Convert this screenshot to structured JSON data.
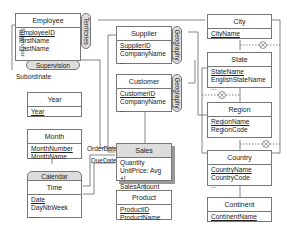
{
  "diagram": {
    "levels": {
      "employee": {
        "title": "Employee",
        "attrs": [
          "EmployeeID",
          "FirstName",
          "LastName"
        ],
        "key": "EmployeeID"
      },
      "supplier": {
        "title": "Supplier",
        "attrs": [
          "SupplierID",
          "CompanyName",
          "..."
        ],
        "key": "SupplierID"
      },
      "customer": {
        "title": "Customer",
        "attrs": [
          "CustomerID",
          "CompanyName",
          "..."
        ],
        "key": "CustomerID"
      },
      "city": {
        "title": "City",
        "attrs": [
          "CityName"
        ],
        "key": "CityName"
      },
      "state": {
        "title": "State",
        "attrs": [
          "StateName",
          "EnglishStateName",
          "..."
        ],
        "key": "StateName"
      },
      "region": {
        "title": "Region",
        "attrs": [
          "RegionName",
          "RegionCode"
        ],
        "key": "RegionName"
      },
      "country": {
        "title": "Country",
        "attrs": [
          "CountryName",
          "CountryCode",
          "..."
        ],
        "key": "CountryName"
      },
      "continent": {
        "title": "Continent",
        "attrs": [
          "ContinentName"
        ],
        "key": "ContinentName"
      },
      "year": {
        "title": "Year",
        "attrs": [
          "Year"
        ],
        "key": "Year"
      },
      "month": {
        "title": "Month",
        "attrs": [
          "MonthNumber",
          "MonthName"
        ],
        "key": "MonthNumber"
      },
      "time": {
        "title": "Time",
        "attrs": [
          "Date",
          "DayNbWeek",
          "..."
        ],
        "key": "Date"
      },
      "product": {
        "title": "Product",
        "attrs": [
          "ProductID",
          "ProductName"
        ],
        "key": "ProductID"
      }
    },
    "fact": {
      "title": "Sales",
      "measures": [
        "Quantity",
        "UnitPrice: Avg +!",
        "SalesAmount"
      ]
    },
    "hierarchies": {
      "supervision": "Supervision",
      "territories": "Territories",
      "geography_supplier": "Geography",
      "geography_customer": "Geography",
      "calendar": "Calendar"
    },
    "roles": {
      "supervisor": "Supervisor",
      "subordinate": "Subordinate",
      "order_date": "OrderDate",
      "due_date": "DueDate"
    },
    "symbols": {
      "exclusive": "⊗"
    }
  }
}
